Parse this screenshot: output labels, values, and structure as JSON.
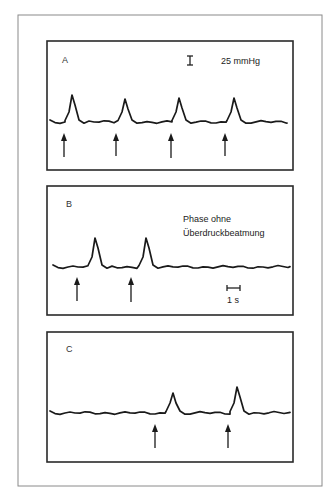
{
  "figure": {
    "outer_frame": {
      "x": 18,
      "y": 15,
      "w": 304,
      "h": 471
    },
    "panels": [
      {
        "id": "A",
        "letter": "A",
        "frame": {
          "x": 47,
          "y": 41,
          "w": 246,
          "h": 129
        },
        "letter_pos": {
          "x": 62,
          "y": 63
        },
        "baseline_y": 122,
        "trace_x_start": 50,
        "trace_x_end": 287,
        "peaks": [
          {
            "x": 72,
            "y": 95
          },
          {
            "x": 125,
            "y": 99
          },
          {
            "x": 179,
            "y": 98
          },
          {
            "x": 234,
            "y": 98
          }
        ],
        "arrows": [
          {
            "x": 64,
            "y_top": 133,
            "y_bottom": 157
          },
          {
            "x": 116,
            "y_top": 133,
            "y_bottom": 156
          },
          {
            "x": 171,
            "y_top": 133,
            "y_bottom": 158
          },
          {
            "x": 225,
            "y_top": 133,
            "y_bottom": 156
          }
        ],
        "scale_bar": {
          "type": "vertical",
          "x": 190,
          "y1": 56,
          "y2": 65
        },
        "annotations": [
          {
            "text": "25 mmHg",
            "x": 221,
            "y": 64
          }
        ]
      },
      {
        "id": "B",
        "letter": "B",
        "frame": {
          "x": 47,
          "y": 186,
          "w": 246,
          "h": 129
        },
        "letter_pos": {
          "x": 66,
          "y": 207
        },
        "baseline_y": 267,
        "trace_x_start": 53,
        "trace_x_end": 290,
        "peaks": [
          {
            "x": 95,
            "y": 238
          },
          {
            "x": 146,
            "y": 238
          }
        ],
        "arrows": [
          {
            "x": 77,
            "y_top": 277,
            "y_bottom": 301
          },
          {
            "x": 131,
            "y_top": 277,
            "y_bottom": 302
          }
        ],
        "scale_bar": {
          "type": "horizontal",
          "x1": 227,
          "x2": 240,
          "y": 288
        },
        "annotations": [
          {
            "text": "Phase ohne",
            "x": 183,
            "y": 222
          },
          {
            "text": "Überdruckbeatmung",
            "x": 183,
            "y": 236
          },
          {
            "text": "1 s",
            "x": 227,
            "y": 303
          }
        ]
      },
      {
        "id": "C",
        "letter": "C",
        "frame": {
          "x": 47,
          "y": 332,
          "w": 246,
          "h": 130
        },
        "letter_pos": {
          "x": 66,
          "y": 352
        },
        "baseline_y": 413,
        "trace_x_start": 50,
        "trace_x_end": 290,
        "peaks": [
          {
            "x": 173,
            "y": 393
          },
          {
            "x": 237,
            "y": 387
          }
        ],
        "arrows": [
          {
            "x": 155,
            "y_top": 424,
            "y_bottom": 448
          },
          {
            "x": 228,
            "y_top": 424,
            "y_bottom": 448
          }
        ],
        "scale_bar": null,
        "annotations": []
      }
    ]
  },
  "labels": {
    "panel_a": "A",
    "panel_b": "B",
    "panel_c": "C",
    "pressure_scale": "25 mmHg",
    "phase_line1": "Phase ohne",
    "phase_line2": "Überdruckbeatmung",
    "time_scale": "1 s"
  }
}
